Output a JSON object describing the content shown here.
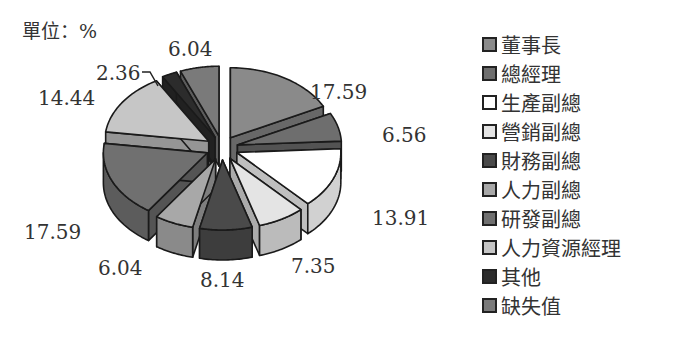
{
  "chart_data": {
    "type": "pie",
    "style": "3d-exploded",
    "title": "",
    "unit_label": "單位：%",
    "categories": [
      "董事長",
      "總經理",
      "生產副總",
      "營銷副總",
      "財務副總",
      "人力副總",
      "研發副總",
      "人力資源經理",
      "其他",
      "缺失值"
    ],
    "values": [
      17.59,
      6.56,
      13.91,
      7.35,
      8.14,
      6.04,
      17.59,
      14.44,
      2.36,
      6.04
    ],
    "value_labels": [
      "17.59",
      "6.56",
      "13.91",
      "7.35",
      "8.14",
      "6.04",
      "17.59",
      "14.44",
      "2.36",
      "6.04"
    ],
    "colors": [
      "#8a8a8a",
      "#6e6e6e",
      "#ffffff",
      "#e4e4e4",
      "#4a4a4a",
      "#a8a8a8",
      "#707070",
      "#c6c6c6",
      "#2c2c2c",
      "#7a7a7a"
    ],
    "legend_position": "right"
  },
  "labels": {
    "unit": "單位：%",
    "legend": [
      "董事長",
      "總經理",
      "生產副總",
      "營銷副總",
      "財務副總",
      "人力副總",
      "研發副總",
      "人力資源經理",
      "其他",
      "缺失值"
    ],
    "slices": [
      "17.59",
      "6.56",
      "13.91",
      "7.35",
      "8.14",
      "6.04",
      "17.59",
      "14.44",
      "2.36",
      "6.04"
    ]
  }
}
